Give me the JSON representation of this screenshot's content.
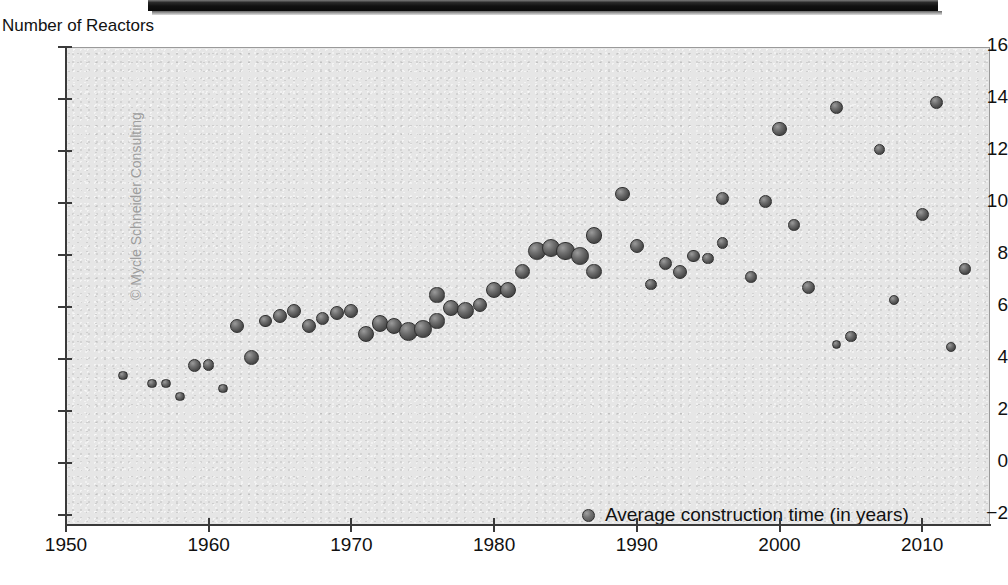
{
  "chart_data": {
    "type": "scatter",
    "title": "",
    "subtitle": "",
    "xlabel": "",
    "ylabel": "Number of Reactors",
    "xlim": [
      1950,
      2015
    ],
    "ylim": [
      -2,
      16
    ],
    "xticks": [
      1950,
      1960,
      1970,
      1980,
      1990,
      2000,
      2010
    ],
    "yticks": [
      -2,
      0,
      2,
      4,
      6,
      8,
      10,
      12,
      14,
      16
    ],
    "grid": false,
    "legend_position": "inside-bottom-right",
    "series": [
      {
        "name": "Average construction time (in years)",
        "size_encodes": "Number of Reactors",
        "points": [
          {
            "x": 1954,
            "y": 3.4,
            "n": 1
          },
          {
            "x": 1956,
            "y": 3.1,
            "n": 1
          },
          {
            "x": 1957,
            "y": 3.1,
            "n": 1
          },
          {
            "x": 1958,
            "y": 2.6,
            "n": 1
          },
          {
            "x": 1959,
            "y": 3.8,
            "n": 3
          },
          {
            "x": 1960,
            "y": 3.8,
            "n": 2
          },
          {
            "x": 1961,
            "y": 2.9,
            "n": 1
          },
          {
            "x": 1962,
            "y": 5.3,
            "n": 4
          },
          {
            "x": 1963,
            "y": 4.1,
            "n": 5
          },
          {
            "x": 1964,
            "y": 5.5,
            "n": 3
          },
          {
            "x": 1965,
            "y": 5.7,
            "n": 4
          },
          {
            "x": 1966,
            "y": 5.9,
            "n": 4
          },
          {
            "x": 1967,
            "y": 5.3,
            "n": 4
          },
          {
            "x": 1968,
            "y": 5.6,
            "n": 3
          },
          {
            "x": 1969,
            "y": 5.8,
            "n": 4
          },
          {
            "x": 1970,
            "y": 5.9,
            "n": 4
          },
          {
            "x": 1971,
            "y": 5.0,
            "n": 6
          },
          {
            "x": 1972,
            "y": 5.4,
            "n": 7
          },
          {
            "x": 1973,
            "y": 5.3,
            "n": 6
          },
          {
            "x": 1974,
            "y": 5.1,
            "n": 10
          },
          {
            "x": 1975,
            "y": 5.2,
            "n": 8
          },
          {
            "x": 1976,
            "y": 5.5,
            "n": 5
          },
          {
            "x": 1976,
            "y": 6.5,
            "n": 5
          },
          {
            "x": 1977,
            "y": 6.0,
            "n": 6
          },
          {
            "x": 1978,
            "y": 5.9,
            "n": 8
          },
          {
            "x": 1979,
            "y": 6.1,
            "n": 4
          },
          {
            "x": 1980,
            "y": 6.7,
            "n": 6
          },
          {
            "x": 1981,
            "y": 6.7,
            "n": 6
          },
          {
            "x": 1982,
            "y": 7.4,
            "n": 5
          },
          {
            "x": 1983,
            "y": 8.2,
            "n": 8
          },
          {
            "x": 1984,
            "y": 8.3,
            "n": 9
          },
          {
            "x": 1985,
            "y": 8.2,
            "n": 9
          },
          {
            "x": 1986,
            "y": 8.0,
            "n": 8
          },
          {
            "x": 1987,
            "y": 8.8,
            "n": 7
          },
          {
            "x": 1987,
            "y": 7.4,
            "n": 5
          },
          {
            "x": 1989,
            "y": 10.4,
            "n": 4
          },
          {
            "x": 1990,
            "y": 8.4,
            "n": 4
          },
          {
            "x": 1991,
            "y": 6.9,
            "n": 2
          },
          {
            "x": 1992,
            "y": 7.7,
            "n": 3
          },
          {
            "x": 1993,
            "y": 7.4,
            "n": 4
          },
          {
            "x": 1994,
            "y": 8.0,
            "n": 3
          },
          {
            "x": 1995,
            "y": 7.9,
            "n": 2
          },
          {
            "x": 1996,
            "y": 10.2,
            "n": 3
          },
          {
            "x": 1996,
            "y": 8.5,
            "n": 2
          },
          {
            "x": 1998,
            "y": 7.2,
            "n": 2
          },
          {
            "x": 1999,
            "y": 10.1,
            "n": 3
          },
          {
            "x": 2000,
            "y": 12.9,
            "n": 4
          },
          {
            "x": 2001,
            "y": 9.2,
            "n": 2
          },
          {
            "x": 2002,
            "y": 6.8,
            "n": 3
          },
          {
            "x": 2004,
            "y": 13.7,
            "n": 3
          },
          {
            "x": 2004,
            "y": 4.6,
            "n": 1
          },
          {
            "x": 2005,
            "y": 4.9,
            "n": 2
          },
          {
            "x": 2007,
            "y": 12.1,
            "n": 2
          },
          {
            "x": 2008,
            "y": 6.3,
            "n": 1
          },
          {
            "x": 2010,
            "y": 9.6,
            "n": 3
          },
          {
            "x": 2011,
            "y": 13.9,
            "n": 3
          },
          {
            "x": 2012,
            "y": 4.5,
            "n": 1
          },
          {
            "x": 2013,
            "y": 7.5,
            "n": 2
          }
        ]
      }
    ]
  },
  "axis": {
    "y_title": "Number of Reactors",
    "y_tick_labels": [
      "16",
      "14",
      "12",
      "10",
      "8",
      "6",
      "4",
      "2",
      "0",
      "−2"
    ],
    "x_tick_labels": [
      "1950",
      "1960",
      "1970",
      "1980",
      "1990",
      "2000",
      "2010"
    ]
  },
  "legend": {
    "label": "Average construction time (in years)"
  },
  "watermark": {
    "text": "© Mycle Schneider Consulting"
  },
  "colors": {
    "plot_background": "#e6e6e6",
    "page_background": "#ffffff",
    "axis": "#3a3a3a",
    "bubble": "#5a5a5a",
    "text": "#111111",
    "watermark": "#9d9d9d"
  }
}
